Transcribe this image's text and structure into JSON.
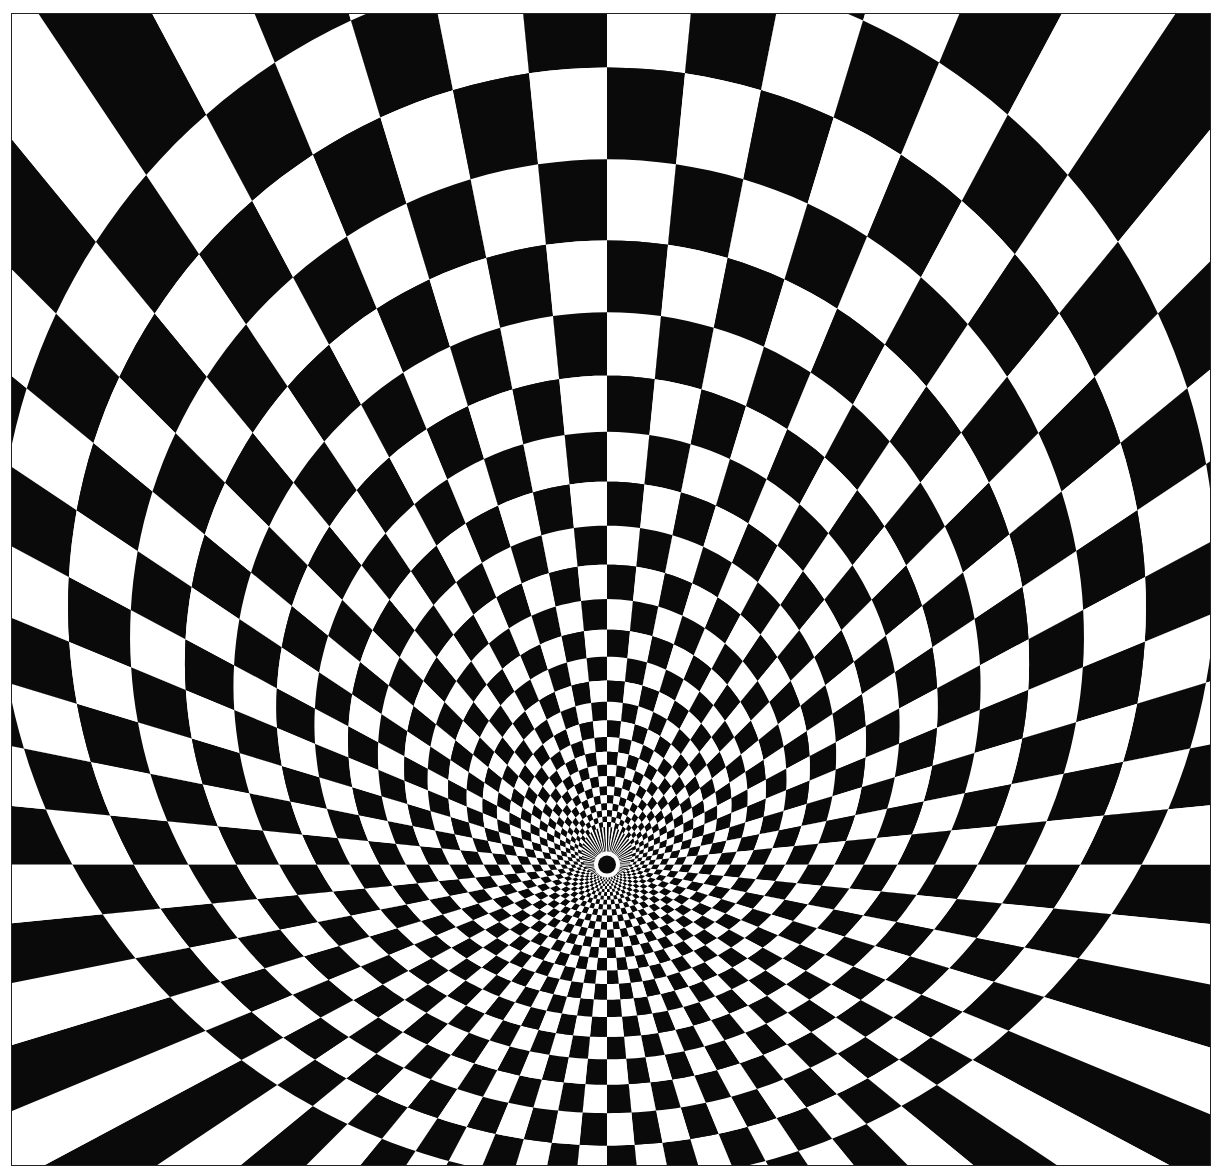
{
  "artwork": {
    "type": "radial-checkerboard-tunnel-illusion",
    "colors": {
      "dark": "#0a0a0a",
      "light": "#ffffff",
      "border": "#222222"
    },
    "frame": {
      "x": 11,
      "y": 13,
      "width": 1200,
      "height": 1153
    },
    "vanishing_point": {
      "x": 596,
      "y": 852
    },
    "spokes": 64,
    "rings": 26,
    "outer_circle": {
      "cx": 596,
      "cy": 560,
      "r": 610
    },
    "center_hole": {
      "r": 9,
      "ring_width": 4
    }
  }
}
